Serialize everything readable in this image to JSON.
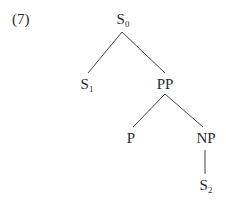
{
  "example_number": "(7)",
  "tree": {
    "nodes": [
      {
        "id": "s0",
        "label": "S",
        "sub": "0"
      },
      {
        "id": "s1",
        "label": "S",
        "sub": "1"
      },
      {
        "id": "pp",
        "label": "PP",
        "sub": ""
      },
      {
        "id": "p",
        "label": "P",
        "sub": ""
      },
      {
        "id": "np",
        "label": "NP",
        "sub": ""
      },
      {
        "id": "s2",
        "label": "S",
        "sub": "2"
      }
    ],
    "edges": [
      [
        "s0",
        "s1"
      ],
      [
        "s0",
        "pp"
      ],
      [
        "pp",
        "p"
      ],
      [
        "pp",
        "np"
      ],
      [
        "np",
        "s2"
      ]
    ]
  }
}
